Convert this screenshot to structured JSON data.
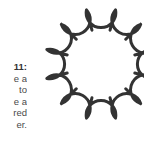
{
  "caption": {
    "lines": [
      "11:",
      "e a",
      "to",
      "e a",
      "red",
      "er."
    ]
  },
  "figure": {
    "shape": "scalloped-flower",
    "petal_count": 12,
    "center": [
      101,
      64
    ],
    "inner_radius": 35,
    "junction_radius": 56,
    "stroke_color": "#333333",
    "stroke_width": 3
  }
}
